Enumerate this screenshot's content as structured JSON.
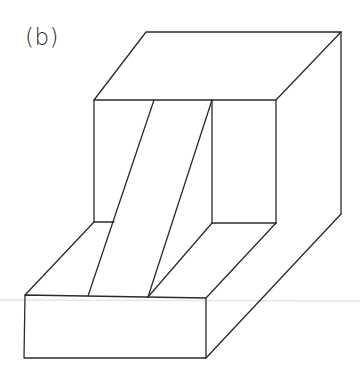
{
  "figure": {
    "label": "(b)",
    "stroke_color": "#2b2b2b",
    "background": "#ffffff"
  }
}
